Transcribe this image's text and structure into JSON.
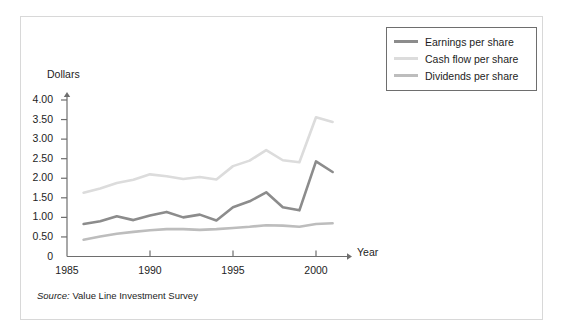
{
  "figure": {
    "source_prefix": "Source:",
    "source_text": " Value Line Investment Survey"
  },
  "legend": {
    "position": "top-right",
    "items": [
      {
        "label": "Earnings per share",
        "color": "#8c8c8c",
        "swatch_name": "legend-swatch-earnings"
      },
      {
        "label": "Cash flow per share",
        "color": "#dcdcdc",
        "swatch_name": "legend-swatch-cash-flow"
      },
      {
        "label": "Dividends per share",
        "color": "#bdbdbd",
        "swatch_name": "legend-swatch-dividends"
      }
    ]
  },
  "chart_data": {
    "type": "line",
    "title": "",
    "xlabel": "Year",
    "ylabel": "Dollars",
    "xlim": [
      1985,
      2002.6
    ],
    "ylim": [
      0,
      4.15
    ],
    "grid": false,
    "legend_position": "top-right",
    "xticks": [
      1985,
      1990,
      1995,
      2000
    ],
    "xtick_labels": [
      "1985",
      "1990",
      "1995",
      "2000"
    ],
    "yticks": [
      0,
      0.5,
      1.0,
      1.5,
      2.0,
      2.5,
      3.0,
      3.5,
      4.0
    ],
    "ytick_labels": [
      "0",
      "0.50",
      "1.00",
      "1.50",
      "2.00",
      "2.50",
      "3.00",
      "3.50",
      "4.00"
    ],
    "x": [
      1986,
      1987,
      1988,
      1989,
      1990,
      1991,
      1992,
      1993,
      1994,
      1995,
      1996,
      1997,
      1998,
      1999,
      2000,
      2001
    ],
    "series": [
      {
        "name": "Earnings per share",
        "color": "#8c8c8c",
        "values": [
          0.83,
          0.9,
          1.03,
          0.93,
          1.05,
          1.14,
          1.0,
          1.07,
          0.92,
          1.26,
          1.41,
          1.64,
          1.26,
          1.18,
          2.43,
          2.16
        ]
      },
      {
        "name": "Cash flow per share",
        "color": "#dcdcdc",
        "values": [
          1.63,
          1.74,
          1.88,
          1.96,
          2.1,
          2.05,
          1.98,
          2.03,
          1.97,
          2.31,
          2.45,
          2.72,
          2.46,
          2.41,
          3.56,
          3.44
        ]
      },
      {
        "name": "Dividends per share",
        "color": "#bdbdbd",
        "values": [
          0.43,
          0.51,
          0.58,
          0.63,
          0.67,
          0.7,
          0.7,
          0.68,
          0.7,
          0.73,
          0.76,
          0.8,
          0.79,
          0.76,
          0.83,
          0.85
        ]
      }
    ]
  }
}
